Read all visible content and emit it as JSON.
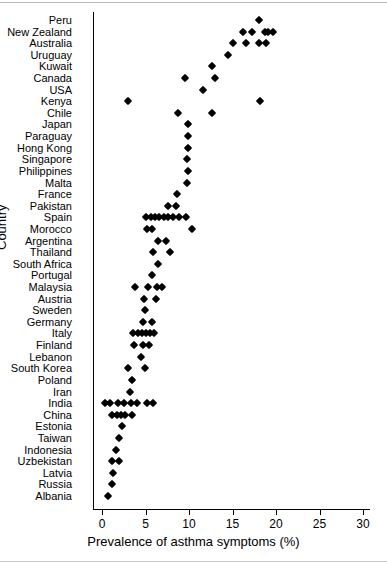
{
  "chart_data": {
    "type": "scatter",
    "title": "",
    "xlabel": "Prevalence of asthma symptoms (%)",
    "ylabel": "Country",
    "xlim": [
      0,
      30
    ],
    "xticks": [
      0,
      5,
      10,
      15,
      20,
      25,
      30
    ],
    "grid": false,
    "legend": "none",
    "orientation": "horizontal-dotplot",
    "categories": [
      "Peru",
      "New Zealand",
      "Australia",
      "Uruguay",
      "Kuwait",
      "Canada",
      "USA",
      "Kenya",
      "Chile",
      "Japan",
      "Paraguay",
      "Hong Kong",
      "Singapore",
      "Philippines",
      "Malta",
      "France",
      "Pakistan",
      "Spain",
      "Morocco",
      "Argentina",
      "Thailand",
      "South Africa",
      "Portugal",
      "Malaysia",
      "Austria",
      "Sweden",
      "Germany",
      "Italy",
      "Finland",
      "Lebanon",
      "South Korea",
      "Poland",
      "Iran",
      "India",
      "China",
      "Estonia",
      "Taiwan",
      "Indonesia",
      "Uzbekistan",
      "Latvia",
      "Russia",
      "Albania"
    ],
    "points": [
      {
        "category": "Peru",
        "values": [
          18.0
        ]
      },
      {
        "category": "New Zealand",
        "values": [
          16.2,
          17.2,
          18.7,
          19.1,
          19.6
        ]
      },
      {
        "category": "Australia",
        "values": [
          15.1,
          16.5,
          18.1,
          18.9
        ]
      },
      {
        "category": "Uruguay",
        "values": [
          14.5
        ]
      },
      {
        "category": "Kuwait",
        "values": [
          12.6
        ]
      },
      {
        "category": "Canada",
        "values": [
          9.5,
          13.0
        ]
      },
      {
        "category": "USA",
        "values": [
          11.6
        ]
      },
      {
        "category": "Kenya",
        "values": [
          3.0,
          18.2
        ]
      },
      {
        "category": "Chile",
        "values": [
          8.7,
          12.6
        ]
      },
      {
        "category": "Japan",
        "values": [
          9.9
        ]
      },
      {
        "category": "Paraguay",
        "values": [
          9.9
        ]
      },
      {
        "category": "Hong Kong",
        "values": [
          9.9
        ]
      },
      {
        "category": "Singapore",
        "values": [
          9.8
        ]
      },
      {
        "category": "Philippines",
        "values": [
          9.9
        ]
      },
      {
        "category": "Malta",
        "values": [
          9.8
        ]
      },
      {
        "category": "France",
        "values": [
          8.6
        ]
      },
      {
        "category": "Pakistan",
        "values": [
          7.6,
          8.5
        ]
      },
      {
        "category": "Spain",
        "values": [
          5.1,
          5.6,
          6.1,
          6.6,
          7.1,
          7.6,
          8.2,
          8.9,
          9.7
        ]
      },
      {
        "category": "Morocco",
        "values": [
          5.2,
          5.8,
          10.4
        ]
      },
      {
        "category": "Argentina",
        "values": [
          6.4,
          7.4
        ]
      },
      {
        "category": "Thailand",
        "values": [
          5.9,
          7.8
        ]
      },
      {
        "category": "South Africa",
        "values": [
          6.4
        ]
      },
      {
        "category": "Portugal",
        "values": [
          5.8
        ]
      },
      {
        "category": "Malaysia",
        "values": [
          3.8,
          5.3,
          6.3,
          6.9
        ]
      },
      {
        "category": "Austria",
        "values": [
          4.8,
          6.2
        ]
      },
      {
        "category": "Sweden",
        "values": [
          4.9
        ]
      },
      {
        "category": "Germany",
        "values": [
          4.7,
          5.8
        ]
      },
      {
        "category": "Italy",
        "values": [
          3.6,
          4.1,
          4.6,
          5.0,
          5.5,
          6.0
        ]
      },
      {
        "category": "Finland",
        "values": [
          3.7,
          4.7,
          5.4
        ]
      },
      {
        "category": "Lebanon",
        "values": [
          4.5
        ]
      },
      {
        "category": "South Korea",
        "values": [
          3.0,
          4.9
        ]
      },
      {
        "category": "Poland",
        "values": [
          3.4
        ]
      },
      {
        "category": "Iran",
        "values": [
          3.2
        ]
      },
      {
        "category": "India",
        "values": [
          0.3,
          0.9,
          1.8,
          2.5,
          3.3,
          4.0,
          5.2,
          5.9
        ]
      },
      {
        "category": "China",
        "values": [
          1.2,
          1.7,
          2.2,
          2.7,
          3.4
        ]
      },
      {
        "category": "Estonia",
        "values": [
          2.3
        ]
      },
      {
        "category": "Taiwan",
        "values": [
          2.0
        ]
      },
      {
        "category": "Indonesia",
        "values": [
          1.6
        ]
      },
      {
        "category": "Uzbekistan",
        "values": [
          1.2,
          2.0
        ]
      },
      {
        "category": "Latvia",
        "values": [
          1.3
        ]
      },
      {
        "category": "Russia",
        "values": [
          1.2
        ]
      },
      {
        "category": "Albania",
        "values": [
          0.7
        ]
      }
    ]
  }
}
